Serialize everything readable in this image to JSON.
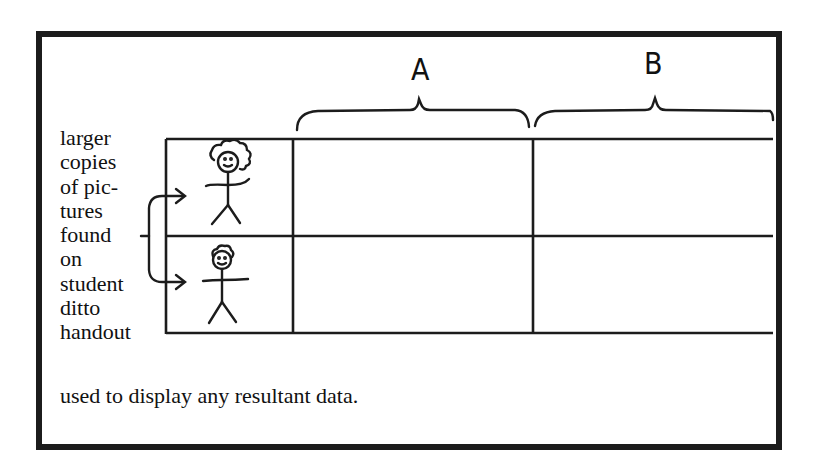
{
  "diagram": {
    "type": "data-display-chart",
    "column_headers": [
      {
        "label": "A"
      },
      {
        "label": "B"
      }
    ],
    "rows": [
      {
        "picture": "curly-haired-stick-figure",
        "cells": [
          "",
          ""
        ]
      },
      {
        "picture": "short-haired-stick-figure",
        "cells": [
          "",
          ""
        ]
      }
    ],
    "side_annotation": {
      "lines": [
        "larger",
        "copies",
        "of pic-",
        "tures",
        "found",
        "on",
        "student",
        "ditto",
        "handout"
      ]
    },
    "footer_annotation": "used to display any resultant data.",
    "colors": {
      "ink": "#1c1c1c",
      "paper": "#ffffff"
    }
  }
}
